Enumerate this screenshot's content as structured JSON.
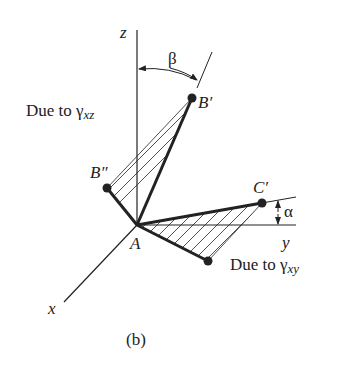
{
  "figure": {
    "caption": "(b)",
    "axes": {
      "x": "x",
      "y": "y",
      "z": "z"
    },
    "points": {
      "origin": "A",
      "b_prime": "B′",
      "b_double_prime": "B″",
      "c_prime": "C′",
      "c_double_prime": "C″"
    },
    "angles": {
      "beta": "β",
      "alpha": "α"
    },
    "annotations": {
      "xz_prefix": "Due to ",
      "xz_symbol": "γ",
      "xz_sub": "xz",
      "xy_prefix": "Due to ",
      "xy_symbol": "γ",
      "xy_sub": "xy"
    },
    "colors": {
      "ink": "#222222",
      "background": "#ffffff"
    }
  }
}
